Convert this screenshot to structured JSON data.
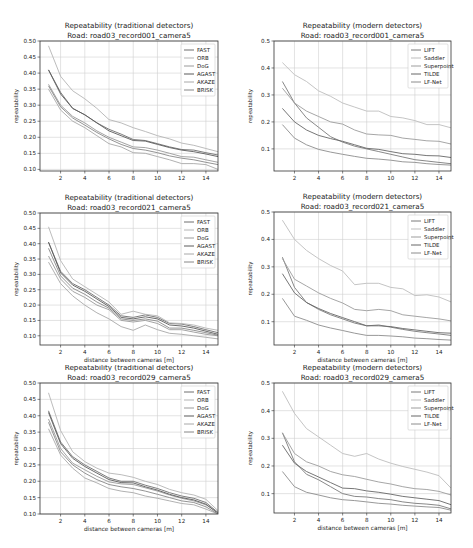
{
  "figure": {
    "xlabel": "distance between cameras [m]",
    "ylabel": "repeatability",
    "line_color": "#7a7a7a",
    "grid_color": "#d0d0d0"
  },
  "chart_data": [
    {
      "id": "trad-001",
      "type": "line",
      "title": "Repeatability (traditional detectors)",
      "subtitle": "Road: road03_record001_camera5",
      "xlabel": "",
      "ylabel": "repeatability",
      "xlim": [
        0.3,
        15
      ],
      "ylim": [
        0.095,
        0.5
      ],
      "xticks": [
        2,
        4,
        6,
        8,
        10,
        12,
        14
      ],
      "yticks": [
        0.1,
        0.15,
        0.2,
        0.25,
        0.3,
        0.35,
        0.4,
        0.45,
        0.5
      ],
      "ytick_format": 2,
      "grid": true,
      "legend_position": "upper right",
      "x": [
        1,
        2,
        3,
        4,
        5,
        6,
        7,
        8,
        9,
        10,
        11,
        12,
        13,
        14,
        15
      ],
      "series": [
        {
          "name": "FAST",
          "color": "#6e6e6e",
          "values": [
            0.41,
            0.34,
            0.29,
            0.27,
            0.245,
            0.225,
            0.21,
            0.193,
            0.19,
            0.18,
            0.17,
            0.162,
            0.16,
            0.152,
            0.145
          ]
        },
        {
          "name": "ORB",
          "color": "#b4b4b4",
          "values": [
            0.485,
            0.39,
            0.345,
            0.32,
            0.29,
            0.255,
            0.245,
            0.23,
            0.218,
            0.205,
            0.195,
            0.182,
            0.175,
            0.165,
            0.155
          ]
        },
        {
          "name": "DoG",
          "color": "#9a9a9a",
          "values": [
            0.365,
            0.3,
            0.265,
            0.245,
            0.22,
            0.2,
            0.185,
            0.17,
            0.168,
            0.16,
            0.15,
            0.14,
            0.138,
            0.13,
            0.122
          ]
        },
        {
          "name": "AGAST",
          "color": "#5a5a5a",
          "values": [
            0.41,
            0.335,
            0.29,
            0.27,
            0.245,
            0.22,
            0.205,
            0.19,
            0.188,
            0.178,
            0.168,
            0.16,
            0.155,
            0.148,
            0.14
          ]
        },
        {
          "name": "AKAZE",
          "color": "#a8a8a8",
          "values": [
            0.35,
            0.285,
            0.25,
            0.23,
            0.205,
            0.18,
            0.17,
            0.152,
            0.15,
            0.14,
            0.13,
            0.118,
            0.118,
            0.115,
            0.1
          ]
        },
        {
          "name": "BRISK",
          "color": "#888888",
          "values": [
            0.36,
            0.295,
            0.26,
            0.238,
            0.215,
            0.195,
            0.178,
            0.165,
            0.16,
            0.152,
            0.142,
            0.135,
            0.13,
            0.122,
            0.115
          ]
        }
      ]
    },
    {
      "id": "modern-001",
      "type": "line",
      "title": "Repeatability (modern detectors)",
      "subtitle": "Road: road03_record001_camera5",
      "xlabel": "distance between cameras [m]",
      "ylabel": "repeatability",
      "xlim": [
        0.3,
        15
      ],
      "ylim": [
        0.018,
        0.5
      ],
      "xticks": [
        2,
        4,
        6,
        8,
        10,
        12,
        14
      ],
      "yticks": [
        0.1,
        0.2,
        0.3,
        0.4,
        0.5
      ],
      "ytick_format": 1,
      "grid": true,
      "legend_position": "upper right",
      "x": [
        1,
        2,
        3,
        4,
        5,
        6,
        7,
        8,
        9,
        10,
        11,
        12,
        13,
        14,
        15
      ],
      "series": [
        {
          "name": "LIFT",
          "color": "#7a7a7a",
          "values": [
            0.35,
            0.27,
            0.215,
            0.18,
            0.145,
            0.125,
            0.11,
            0.1,
            0.09,
            0.08,
            0.07,
            0.06,
            0.055,
            0.05,
            0.045
          ]
        },
        {
          "name": "Saddler",
          "color": "#bdbdbd",
          "values": [
            0.42,
            0.375,
            0.35,
            0.315,
            0.295,
            0.27,
            0.255,
            0.24,
            0.24,
            0.22,
            0.215,
            0.205,
            0.19,
            0.19,
            0.178
          ]
        },
        {
          "name": "Superpoint",
          "color": "#9c9c9c",
          "values": [
            0.325,
            0.27,
            0.24,
            0.22,
            0.2,
            0.192,
            0.17,
            0.155,
            0.152,
            0.15,
            0.14,
            0.135,
            0.13,
            0.128,
            0.118
          ]
        },
        {
          "name": "TILDE",
          "color": "#666666",
          "values": [
            0.25,
            0.2,
            0.17,
            0.15,
            0.138,
            0.128,
            0.115,
            0.102,
            0.098,
            0.09,
            0.082,
            0.08,
            0.075,
            0.074,
            0.068
          ]
        },
        {
          "name": "LF-Net",
          "color": "#8c8c8c",
          "values": [
            0.19,
            0.14,
            0.115,
            0.098,
            0.088,
            0.08,
            0.072,
            0.065,
            0.062,
            0.058,
            0.052,
            0.05,
            0.045,
            0.042,
            0.04
          ]
        }
      ]
    },
    {
      "id": "trad-021",
      "type": "line",
      "title": "Repeatability (traditional detectors)",
      "subtitle": "Road: road03_record021_camera5",
      "xlabel": "distance between cameras [m]",
      "ylabel": "repeatability",
      "xlim": [
        0.3,
        15
      ],
      "ylim": [
        0.07,
        0.5
      ],
      "xticks": [
        2,
        4,
        6,
        8,
        10,
        12,
        14
      ],
      "yticks": [
        0.1,
        0.15,
        0.2,
        0.25,
        0.3,
        0.35,
        0.4,
        0.45,
        0.5
      ],
      "ytick_format": 2,
      "grid": true,
      "legend_position": "upper right",
      "x": [
        1,
        2,
        3,
        4,
        5,
        6,
        7,
        8,
        9,
        10,
        11,
        12,
        13,
        14,
        15
      ],
      "series": [
        {
          "name": "FAST",
          "color": "#6e6e6e",
          "values": [
            0.405,
            0.31,
            0.27,
            0.25,
            0.225,
            0.2,
            0.165,
            0.16,
            0.168,
            0.16,
            0.14,
            0.138,
            0.13,
            0.12,
            0.11
          ]
        },
        {
          "name": "ORB",
          "color": "#b4b4b4",
          "values": [
            0.455,
            0.345,
            0.285,
            0.26,
            0.235,
            0.21,
            0.17,
            0.18,
            0.17,
            0.165,
            0.142,
            0.14,
            0.135,
            0.125,
            0.118
          ]
        },
        {
          "name": "DoG",
          "color": "#9a9a9a",
          "values": [
            0.36,
            0.285,
            0.245,
            0.225,
            0.2,
            0.185,
            0.15,
            0.145,
            0.15,
            0.14,
            0.12,
            0.12,
            0.112,
            0.105,
            0.1
          ]
        },
        {
          "name": "AGAST",
          "color": "#5a5a5a",
          "values": [
            0.405,
            0.305,
            0.265,
            0.245,
            0.22,
            0.195,
            0.16,
            0.155,
            0.162,
            0.155,
            0.135,
            0.132,
            0.125,
            0.115,
            0.105
          ]
        },
        {
          "name": "AKAZE",
          "color": "#a8a8a8",
          "values": [
            0.34,
            0.27,
            0.23,
            0.2,
            0.175,
            0.155,
            0.13,
            0.118,
            0.135,
            0.12,
            0.108,
            0.105,
            0.1,
            0.095,
            0.09
          ]
        },
        {
          "name": "BRISK",
          "color": "#888888",
          "values": [
            0.385,
            0.295,
            0.255,
            0.235,
            0.21,
            0.19,
            0.155,
            0.15,
            0.155,
            0.148,
            0.125,
            0.125,
            0.118,
            0.11,
            0.102
          ]
        }
      ]
    },
    {
      "id": "modern-021",
      "type": "line",
      "title": "Repeatability (modern detectors)",
      "subtitle": "Road: road03_record021_camera5",
      "xlabel": "distance between cameras [m]",
      "ylabel": "repeatability",
      "xlim": [
        0.3,
        15
      ],
      "ylim": [
        0.015,
        0.5
      ],
      "xticks": [
        2,
        4,
        6,
        8,
        10,
        12,
        14
      ],
      "yticks": [
        0.1,
        0.2,
        0.3,
        0.4,
        0.5
      ],
      "ytick_format": 1,
      "grid": true,
      "legend_position": "upper right",
      "x": [
        1,
        2,
        3,
        4,
        5,
        6,
        7,
        8,
        9,
        10,
        11,
        12,
        13,
        14,
        15
      ],
      "series": [
        {
          "name": "LIFT",
          "color": "#7a7a7a",
          "values": [
            0.335,
            0.225,
            0.17,
            0.145,
            0.125,
            0.11,
            0.095,
            0.085,
            0.088,
            0.08,
            0.072,
            0.065,
            0.06,
            0.055,
            0.05
          ]
        },
        {
          "name": "Saddler",
          "color": "#bdbdbd",
          "values": [
            0.47,
            0.4,
            0.36,
            0.33,
            0.305,
            0.285,
            0.235,
            0.24,
            0.24,
            0.225,
            0.22,
            0.195,
            0.198,
            0.19,
            0.172
          ]
        },
        {
          "name": "Superpoint",
          "color": "#9c9c9c",
          "values": [
            0.33,
            0.255,
            0.23,
            0.205,
            0.185,
            0.168,
            0.145,
            0.14,
            0.145,
            0.14,
            0.125,
            0.12,
            0.115,
            0.11,
            0.103
          ]
        },
        {
          "name": "TILDE",
          "color": "#666666",
          "values": [
            0.275,
            0.205,
            0.17,
            0.148,
            0.13,
            0.115,
            0.1,
            0.085,
            0.085,
            0.082,
            0.075,
            0.07,
            0.065,
            0.06,
            0.058
          ]
        },
        {
          "name": "LF-Net",
          "color": "#8c8c8c",
          "values": [
            0.185,
            0.12,
            0.105,
            0.088,
            0.077,
            0.068,
            0.058,
            0.05,
            0.05,
            0.048,
            0.045,
            0.04,
            0.038,
            0.035,
            0.033
          ]
        }
      ]
    },
    {
      "id": "trad-029",
      "type": "line",
      "title": "Repeatability (traditional detectors)",
      "subtitle": "Road: road03_record029_camera5",
      "xlabel": "distance between cameras [m]",
      "ylabel": "repeatability",
      "xlim": [
        0.3,
        15
      ],
      "ylim": [
        0.1,
        0.5
      ],
      "xticks": [
        2,
        4,
        6,
        8,
        10,
        12,
        14
      ],
      "yticks": [
        0.1,
        0.15,
        0.2,
        0.25,
        0.3,
        0.35,
        0.4,
        0.45,
        0.5
      ],
      "ytick_format": 2,
      "grid": true,
      "legend_position": "upper right",
      "x": [
        1,
        2,
        3,
        4,
        5,
        6,
        7,
        8,
        9,
        10,
        11,
        12,
        13,
        14,
        15
      ],
      "series": [
        {
          "name": "FAST",
          "color": "#6e6e6e",
          "values": [
            0.415,
            0.32,
            0.275,
            0.25,
            0.23,
            0.21,
            0.2,
            0.2,
            0.188,
            0.178,
            0.165,
            0.155,
            0.148,
            0.135,
            0.105
          ]
        },
        {
          "name": "ORB",
          "color": "#b4b4b4",
          "values": [
            0.47,
            0.355,
            0.29,
            0.26,
            0.24,
            0.225,
            0.22,
            0.212,
            0.2,
            0.19,
            0.175,
            0.165,
            0.158,
            0.145,
            0.11
          ]
        },
        {
          "name": "DoG",
          "color": "#9a9a9a",
          "values": [
            0.39,
            0.3,
            0.255,
            0.235,
            0.215,
            0.198,
            0.192,
            0.19,
            0.18,
            0.17,
            0.158,
            0.148,
            0.14,
            0.128,
            0.105
          ]
        },
        {
          "name": "AGAST",
          "color": "#5a5a5a",
          "values": [
            0.41,
            0.315,
            0.27,
            0.245,
            0.225,
            0.205,
            0.196,
            0.195,
            0.183,
            0.173,
            0.16,
            0.15,
            0.143,
            0.13,
            0.102
          ]
        },
        {
          "name": "AKAZE",
          "color": "#a8a8a8",
          "values": [
            0.36,
            0.28,
            0.24,
            0.21,
            0.195,
            0.178,
            0.17,
            0.165,
            0.155,
            0.148,
            0.14,
            0.132,
            0.128,
            0.115,
            0.1
          ]
        },
        {
          "name": "BRISK",
          "color": "#888888",
          "values": [
            0.38,
            0.29,
            0.25,
            0.225,
            0.205,
            0.19,
            0.183,
            0.178,
            0.17,
            0.16,
            0.15,
            0.14,
            0.135,
            0.122,
            0.1
          ]
        }
      ]
    },
    {
      "id": "modern-029",
      "type": "line",
      "title": "Repeatability (modern detectors)",
      "subtitle": "Road: road03_record029_camera5",
      "xlabel": "distance between cameras [m]",
      "ylabel": "repeatability",
      "xlim": [
        0.3,
        15
      ],
      "ylim": [
        0.03,
        0.5
      ],
      "xticks": [
        2,
        4,
        6,
        8,
        10,
        12,
        14
      ],
      "yticks": [
        0.1,
        0.2,
        0.3,
        0.4,
        0.5
      ],
      "ytick_format": 1,
      "grid": true,
      "legend_position": "upper right",
      "x": [
        1,
        2,
        3,
        4,
        5,
        6,
        7,
        8,
        9,
        10,
        11,
        12,
        13,
        14,
        15
      ],
      "series": [
        {
          "name": "LIFT",
          "color": "#7a7a7a",
          "values": [
            0.32,
            0.215,
            0.17,
            0.15,
            0.125,
            0.1,
            0.09,
            0.088,
            0.082,
            0.078,
            0.07,
            0.065,
            0.062,
            0.058,
            0.045
          ]
        },
        {
          "name": "Saddler",
          "color": "#bdbdbd",
          "values": [
            0.47,
            0.39,
            0.335,
            0.305,
            0.275,
            0.245,
            0.235,
            0.245,
            0.225,
            0.21,
            0.198,
            0.188,
            0.178,
            0.165,
            0.12
          ]
        },
        {
          "name": "Superpoint",
          "color": "#9c9c9c",
          "values": [
            0.32,
            0.245,
            0.215,
            0.2,
            0.18,
            0.168,
            0.162,
            0.152,
            0.142,
            0.135,
            0.125,
            0.118,
            0.115,
            0.108,
            0.095
          ]
        },
        {
          "name": "TILDE",
          "color": "#666666",
          "values": [
            0.275,
            0.21,
            0.18,
            0.16,
            0.14,
            0.12,
            0.118,
            0.11,
            0.105,
            0.098,
            0.09,
            0.085,
            0.08,
            0.075,
            0.06
          ]
        },
        {
          "name": "LF-Net",
          "color": "#8c8c8c",
          "values": [
            0.18,
            0.125,
            0.105,
            0.095,
            0.085,
            0.078,
            0.075,
            0.07,
            0.065,
            0.062,
            0.058,
            0.055,
            0.052,
            0.05,
            0.04
          ]
        }
      ]
    }
  ],
  "layout": {
    "panels": [
      {
        "left": 0,
        "top": 0,
        "frame": {
          "x0": 40,
          "y0": 41,
          "x1": 218,
          "y1": 171
        },
        "show_xlabel": true
      },
      {
        "left": 236,
        "top": 0,
        "frame": {
          "x0": 38,
          "y0": 41,
          "x1": 215,
          "y1": 171
        },
        "show_xlabel": true
      },
      {
        "left": 0,
        "top": 182,
        "frame": {
          "x0": 40,
          "y0": 31,
          "x1": 218,
          "y1": 163
        },
        "show_xlabel": true
      },
      {
        "left": 236,
        "top": 182,
        "frame": {
          "x0": 38,
          "y0": 30,
          "x1": 215,
          "y1": 163
        },
        "show_xlabel": true
      },
      {
        "left": 0,
        "top": 365,
        "frame": {
          "x0": 40,
          "y0": 18,
          "x1": 218,
          "y1": 149
        },
        "show_xlabel": true
      },
      {
        "left": 236,
        "top": 365,
        "frame": {
          "x0": 38,
          "y0": 18,
          "x1": 215,
          "y1": 148
        },
        "show_xlabel": true
      }
    ]
  }
}
